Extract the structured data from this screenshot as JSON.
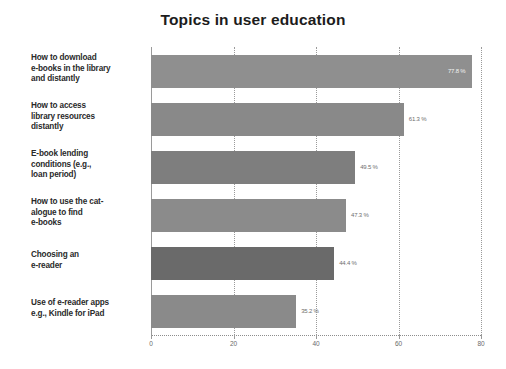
{
  "chart_data": {
    "type": "bar",
    "orientation": "horizontal",
    "title": "Topics in user education",
    "xlabel": "",
    "ylabel": "",
    "xlim": [
      0,
      80
    ],
    "xticks": [
      "0",
      "20",
      "40",
      "60",
      "80"
    ],
    "grid": true,
    "legend": false,
    "categories": [
      "How to download e-books in the library and distantly",
      "How to access library resources distantly",
      "E-book lending conditions (e.g., loan period)",
      "How to use the cat-alogue to find e-books",
      "Choosing an e-reader",
      "Use of e-reader apps e.g., Kindle for iPad"
    ],
    "category_lines": [
      [
        "How to download",
        "e-books in the library",
        "and distantly"
      ],
      [
        "How to access",
        "library resources",
        "distantly"
      ],
      [
        "E-book lending",
        "conditions (e.g.,",
        "loan period)"
      ],
      [
        "How to use the cat-",
        "alogue to find",
        "e-books"
      ],
      [
        "Choosing an",
        "e-reader"
      ],
      [
        "Use of e-reader apps",
        "e.g., Kindle for iPad"
      ]
    ],
    "values": [
      77.8,
      61.3,
      49.5,
      47.3,
      44.4,
      35.2
    ],
    "value_labels": [
      "77.8 %",
      "61.3 %",
      "49.5 %",
      "47.3 %",
      "44.4 %",
      "35.2 %"
    ],
    "bar_colors": [
      "#8f8f8f",
      "#898989",
      "#7e7e7e",
      "#8b8b8b",
      "#6a6a6a",
      "#8a8a8a"
    ],
    "label_inside": [
      true,
      false,
      false,
      false,
      false,
      false
    ]
  }
}
